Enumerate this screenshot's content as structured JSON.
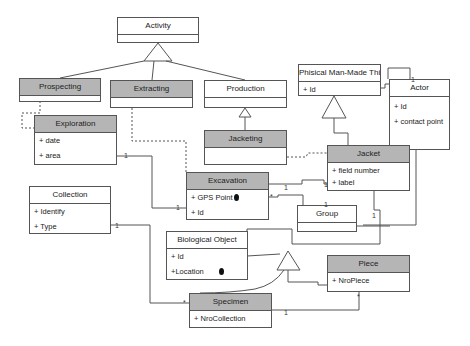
{
  "diagram": {
    "type": "UML class diagram",
    "classes": {
      "activity": {
        "name": "Activity",
        "attributes": []
      },
      "prospecting": {
        "name": "Prospecting",
        "attributes": []
      },
      "extracting": {
        "name": "Extracting",
        "attributes": []
      },
      "production": {
        "name": "Production",
        "attributes": []
      },
      "phisical_man_made_thing": {
        "name": "Phisical Man-Made Thing",
        "attributes": [
          "+ Id"
        ]
      },
      "actor": {
        "name": "Actor",
        "attributes": [
          "+ Id",
          "+ contact point"
        ]
      },
      "exploration": {
        "name": "Exploration",
        "attributes": [
          "+ date",
          "+ area"
        ]
      },
      "jacketing": {
        "name": "Jacketing",
        "attributes": []
      },
      "jacket": {
        "name": "Jacket",
        "attributes": [
          "+ field number",
          "+ label"
        ]
      },
      "excavation": {
        "name": "Excavation",
        "attributes": [
          "+ GPS Point",
          "+ Id"
        ]
      },
      "collection": {
        "name": "Collection",
        "attributes": [
          "+ Identify",
          "+ Type"
        ]
      },
      "group": {
        "name": "Group",
        "attributes": []
      },
      "biological_object": {
        "name": "Biological Object",
        "attributes": [
          "+ Id",
          "+Location"
        ]
      },
      "piece": {
        "name": "Piece",
        "attributes": [
          "+ NroPiece"
        ]
      },
      "specimen": {
        "name": "Specimen",
        "attributes": [
          "+ NroCollection"
        ]
      }
    },
    "multiplicities": {
      "actor_self": "1",
      "exploration_excavation_a": "1",
      "exploration_excavation_b": "1",
      "excavation_jacket_a": "1",
      "excavation_jacket_b": "1",
      "excavation_group_a": "*",
      "excavation_group_b": "1",
      "jacket_bio": "1",
      "collection_specimen_a": "1",
      "collection_specimen_b": "*",
      "specimen_piece_a": "1",
      "specimen_piece_b": "*"
    },
    "colors": {
      "header_highlight": "#b5b5b5",
      "border": "#555555",
      "area_shape": "#555555"
    }
  }
}
